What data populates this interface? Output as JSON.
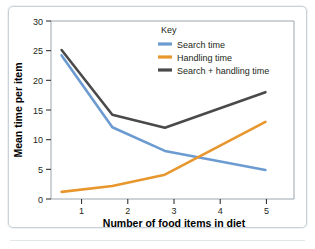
{
  "chart_data": {
    "type": "line",
    "title": "",
    "xlabel": "Number of food items in diet",
    "ylabel": "Mean time per item",
    "xlim": [
      0.35,
      5.62
    ],
    "ylim": [
      0,
      30
    ],
    "xticks": [
      1,
      2,
      3,
      4,
      5
    ],
    "yticks": [
      0,
      5,
      10,
      15,
      20,
      25,
      30
    ],
    "grid": false,
    "legend_position": "top-right-inside",
    "legend_title": "Key",
    "series": [
      {
        "name": "Search time",
        "color": "#6b9bd1",
        "x": [
          0.58,
          1.68,
          2.82,
          5.0
        ],
        "values": [
          24.2,
          12.1,
          8.1,
          4.9
        ]
      },
      {
        "name": "Handling time",
        "color": "#e8962e",
        "x": [
          0.58,
          1.68,
          2.82,
          5.0
        ],
        "values": [
          1.2,
          2.2,
          4.1,
          13.0
        ]
      },
      {
        "name": "Search + handling time",
        "color": "#4a4a4a",
        "x": [
          0.58,
          1.68,
          2.82,
          5.0
        ],
        "values": [
          25.1,
          14.2,
          12.0,
          18.0
        ]
      }
    ]
  },
  "axes": {
    "y_label": "Mean time per item",
    "x_label": "Number of food items in diet",
    "y_tick_labels": [
      "0",
      "5",
      "10",
      "15",
      "20",
      "25",
      "30"
    ],
    "x_tick_labels": [
      "1",
      "2",
      "3",
      "4",
      "5"
    ]
  },
  "legend": {
    "title": "Key",
    "entries": [
      {
        "label": "Search time",
        "color": "#6b9bd1"
      },
      {
        "label": "Handling time",
        "color": "#e8962e"
      },
      {
        "label": "Search + handling time",
        "color": "#4a4a4a"
      }
    ]
  },
  "colors": {
    "search": "#6b9bd1",
    "handling": "#e8962e",
    "total": "#4a4a4a",
    "axis": "#231f20",
    "frame": "#c9d2d8"
  }
}
